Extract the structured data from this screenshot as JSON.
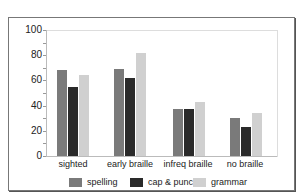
{
  "chart_data": {
    "type": "bar",
    "title": "",
    "xlabel": "",
    "ylabel": "",
    "ylim": [
      0,
      100
    ],
    "yticks": [
      0,
      20,
      40,
      60,
      80,
      100
    ],
    "categories": [
      "sighted",
      "early braille",
      "infreq braille",
      "no braille"
    ],
    "series": [
      {
        "name": "spelling",
        "color": "#7a7a7a",
        "values": [
          68,
          69,
          37,
          30
        ]
      },
      {
        "name": "cap & punc",
        "color": "#2a2a2a",
        "values": [
          55,
          62,
          37,
          23
        ]
      },
      {
        "name": "grammar",
        "color": "#d0d0d0",
        "values": [
          64,
          82,
          43,
          34
        ]
      }
    ],
    "grid": false,
    "legend_position": "bottom"
  },
  "axis": {
    "y_ticks": [
      "0",
      "20",
      "40",
      "60",
      "80",
      "100"
    ]
  },
  "x_labels": [
    "sighted",
    "early braille",
    "infreq braille",
    "no braille"
  ],
  "legend": {
    "items": [
      {
        "label": "spelling",
        "color": "#7a7a7a"
      },
      {
        "label": "cap & punc",
        "color": "#2a2a2a"
      },
      {
        "label": "grammar",
        "color": "#d0d0d0"
      }
    ]
  }
}
